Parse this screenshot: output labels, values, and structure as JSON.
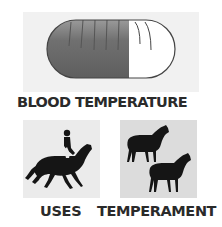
{
  "top": {
    "icon": "thermometer-pill-icon",
    "fill_ratio": 0.64,
    "fill_color": "#6b6b6b",
    "empty_color": "#ffffff",
    "label": "BLOOD TEMPERATURE"
  },
  "uses": {
    "icon": "horse-and-rider-icon",
    "label": "USES"
  },
  "temperament": {
    "icon": "two-horses-icon",
    "label": "TEMPERAMENT"
  }
}
